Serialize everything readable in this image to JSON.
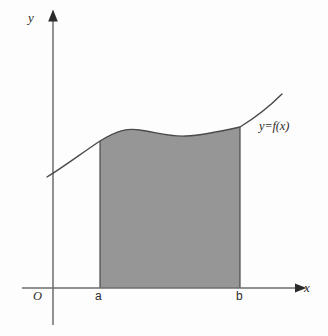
{
  "figure": {
    "kind": "area-under-curve-diagram",
    "background_color": "#fdfdfd",
    "stroke_color": "#555555",
    "shade_color": "#969696",
    "text_color": "#2b2b2b"
  },
  "axes": {
    "y_axis_label": "y",
    "x_axis_label": "x",
    "origin_label": "O",
    "x_axis_y_px": 288,
    "y_axis_x_px": 53,
    "x_axis_start_px": 22,
    "x_axis_end_px": 300,
    "y_axis_top_px": 14,
    "y_axis_bottom_px": 325,
    "arrowheads": [
      "x-axis-right",
      "y-axis-top"
    ]
  },
  "ticks": {
    "lower_limit_label": "a",
    "upper_limit_label": "b",
    "lower_limit_x_px": 100,
    "upper_limit_x_px": 240
  },
  "curve": {
    "label": "y=f(x)",
    "label_x_px": 259,
    "label_y_px": 120,
    "path": "M 47,177 C 62,168 82,153 100,141 C 118,130 128,128 140,130 C 155,132 170,137 186,136 C 205,135 222,131 240,127 C 258,116 272,104 282,94",
    "start_point_px": [
      47,
      177
    ],
    "end_point_px": [
      282,
      94
    ]
  },
  "shaded_region": {
    "description": "Region bounded above by y=f(x), below by the x-axis, left by x=a, right by x=b",
    "fill": "#969696",
    "path": "M 100,141 C 118,130 128,128 140,130 C 155,132 170,137 186,136 C 205,135 222,131 240,127 L 240,288 L 100,288 Z",
    "left_edge_x_px": 100,
    "right_edge_x_px": 240,
    "baseline_y_px": 288
  },
  "chart_data": {
    "type": "area",
    "title": "",
    "xlabel": "x",
    "ylabel": "y",
    "legend": [
      "y=f(x)"
    ],
    "annotations": [
      "O",
      "a",
      "b",
      "y=f(x)"
    ],
    "grid": false,
    "shaded_interval": [
      "a",
      "b"
    ],
    "x": [
      47,
      60,
      75,
      90,
      100,
      115,
      130,
      140,
      155,
      170,
      186,
      200,
      215,
      230,
      240,
      255,
      270,
      282
    ],
    "y_pixel": [
      177,
      169,
      158,
      148,
      141,
      134,
      130,
      130,
      132,
      136,
      136,
      135,
      132,
      129,
      127,
      117,
      105,
      94
    ],
    "note": "y_pixel values are screen coordinates (smaller = higher on the plot)"
  }
}
